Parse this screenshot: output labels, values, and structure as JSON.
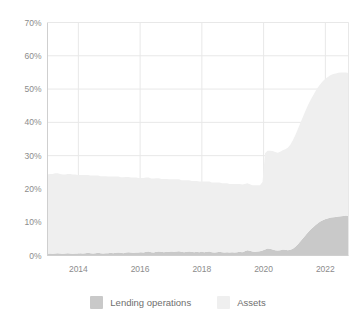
{
  "chart_data": {
    "type": "area",
    "stacked": true,
    "title": "",
    "subtitle": "",
    "xlabel": "",
    "ylabel": "",
    "ylim": [
      0,
      70
    ],
    "y_tick_labels": [
      "0%",
      "10%",
      "20%",
      "30%",
      "40%",
      "50%",
      "60%",
      "70%"
    ],
    "y_tick_values": [
      0,
      10,
      20,
      30,
      40,
      50,
      60,
      70
    ],
    "x_tick_labels": [
      "2014",
      "2016",
      "2018",
      "2020",
      "2022"
    ],
    "x_tick_values": [
      2014,
      2016,
      2018,
      2020,
      2022
    ],
    "xlim": [
      2013.0,
      2022.75
    ],
    "grid": "horizontal",
    "legend_position": "bottom-center",
    "colors": {
      "lending_operations": "#c9c9c9",
      "assets": "#efefef",
      "gridline": "#e8e8e8",
      "axis": "#cfcfcf",
      "tick_text": "#8c8c8c",
      "legend_text": "#6e6e6e",
      "background": "#ffffff"
    },
    "series": [
      {
        "name": "Lending operations",
        "color": "#c9c9c9",
        "values": [
          0.5,
          0.6,
          0.5,
          0.6,
          0.7,
          0.6,
          0.5,
          0.6,
          0.7,
          0.6,
          0.5,
          0.6,
          0.6,
          0.7,
          0.6,
          0.7,
          0.8,
          0.7,
          0.6,
          0.7,
          0.8,
          0.7,
          0.6,
          0.7,
          0.7,
          0.8,
          0.7,
          0.8,
          0.9,
          0.8,
          0.7,
          0.9,
          1.0,
          0.9,
          0.8,
          0.9,
          0.9,
          1.0,
          0.9,
          1.1,
          1.2,
          1.0,
          0.9,
          1.1,
          1.2,
          1.1,
          1.0,
          1.1,
          1.1,
          1.2,
          1.1,
          1.2,
          1.3,
          1.1,
          1.0,
          1.1,
          1.2,
          1.1,
          1.0,
          1.1,
          1.0,
          1.1,
          1.0,
          1.1,
          1.2,
          1.0,
          0.9,
          1.0,
          1.1,
          1.0,
          0.9,
          1.0,
          0.9,
          1.0,
          0.9,
          1.0,
          1.1,
          1.0,
          1.3,
          1.6,
          1.4,
          1.2,
          1.1,
          1.2,
          1.3,
          1.5,
          1.8,
          2.1,
          2.0,
          1.8,
          1.6,
          1.5,
          1.6,
          1.8,
          1.7,
          1.6,
          1.7,
          2.0,
          2.6,
          3.4,
          4.3,
          5.2,
          6.1,
          7.0,
          7.8,
          8.5,
          9.2,
          9.8,
          10.3,
          10.7,
          11.0,
          11.2,
          11.4,
          11.5,
          11.6,
          11.7,
          11.8,
          11.9,
          12.0,
          11.9
        ]
      },
      {
        "name": "Assets",
        "color": "#efefef",
        "values": [
          23.8,
          23.9,
          24.0,
          24.1,
          24.0,
          23.9,
          23.8,
          23.7,
          23.8,
          23.9,
          23.8,
          23.7,
          23.6,
          23.5,
          23.6,
          23.5,
          23.4,
          23.3,
          23.4,
          23.3,
          23.2,
          23.1,
          23.2,
          23.1,
          23.0,
          22.9,
          23.0,
          22.9,
          22.8,
          22.7,
          22.8,
          22.7,
          22.6,
          22.5,
          22.6,
          22.5,
          22.4,
          22.3,
          22.4,
          22.3,
          22.2,
          22.1,
          22.2,
          22.1,
          22.0,
          21.9,
          22.0,
          21.9,
          21.8,
          21.7,
          21.8,
          21.7,
          21.6,
          21.5,
          21.6,
          21.5,
          21.4,
          21.3,
          21.4,
          21.3,
          21.2,
          21.1,
          21.2,
          21.1,
          21.0,
          20.9,
          21.0,
          20.9,
          20.8,
          20.7,
          20.8,
          20.7,
          20.6,
          20.5,
          20.6,
          20.5,
          20.4,
          20.3,
          20.2,
          20.1,
          20.0,
          19.9,
          20.0,
          19.9,
          19.8,
          20.6,
          28.9,
          29.4,
          29.5,
          29.6,
          29.5,
          29.4,
          29.6,
          29.8,
          30.2,
          30.8,
          31.6,
          32.6,
          33.6,
          34.6,
          35.6,
          36.5,
          37.4,
          38.2,
          38.9,
          39.6,
          40.2,
          40.8,
          41.3,
          41.8,
          42.2,
          42.5,
          42.8,
          43.0,
          43.1,
          43.2,
          43.2,
          43.1,
          43.0,
          42.9
        ]
      }
    ]
  },
  "legend": {
    "items": [
      {
        "label": "Lending operations",
        "color": "#c9c9c9"
      },
      {
        "label": "Assets",
        "color": "#efefef"
      }
    ]
  }
}
